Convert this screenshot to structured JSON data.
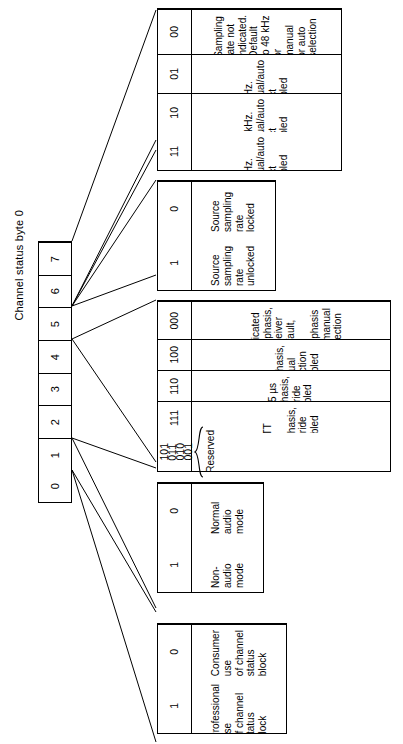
{
  "diagram": {
    "title": "Channel status byte 0"
  },
  "bit_strip": {
    "name": "channel-status-byte-0-bits",
    "bits": [
      {
        "label": "0"
      },
      {
        "label": "1"
      },
      {
        "label": "2"
      },
      {
        "label": "3"
      },
      {
        "label": "4"
      },
      {
        "label": "5"
      },
      {
        "label": "6"
      },
      {
        "label": "7"
      }
    ]
  },
  "tables": [
    {
      "id": "sampling-rate-table",
      "source_bits": "6,7",
      "rows": [
        {
          "code": "00",
          "desc": "Sampling rate not\nindicated. Default\nto 48 kHz or manual\nor auto selection"
        },
        {
          "code": "01",
          "desc": "48 kHz. Manual/auto\nselect disabled"
        },
        {
          "code": "10",
          "desc": "44.1 kHz. Manual/auto\nselect disabled"
        },
        {
          "code": "11",
          "desc": "32 kHz. Manual/auto\nselect disabled"
        }
      ]
    },
    {
      "id": "source-lock-table",
      "source_bits": "5",
      "rows": [
        {
          "code": "0",
          "desc": "Source sampling\nrate locked"
        },
        {
          "code": "1",
          "desc": "Source sampling\nrate unlocked"
        }
      ]
    },
    {
      "id": "emphasis-table",
      "source_bits": "2,3,4",
      "rows": [
        {
          "code": "000",
          "desc": "No indicated emphasis,\nreceiver default, no\nemphasis or manual\nselection"
        },
        {
          "code": "100",
          "desc": "No emphasis, manual\nselection disabled"
        },
        {
          "code": "110",
          "desc": "50/15 µs emphasis,\noverride disabled"
        },
        {
          "code": "111",
          "desc": "CCITT J.17 emphasis,\noverride disabled"
        }
      ],
      "reserved_row": {
        "codes": [
          "001",
          "010",
          "011",
          "101"
        ],
        "label": "Reserved"
      }
    },
    {
      "id": "audio-mode-table",
      "source_bits": "1",
      "rows": [
        {
          "code": "0",
          "desc": "Normal audio\nmode"
        },
        {
          "code": "1",
          "desc": "Non-audio\nmode"
        }
      ]
    },
    {
      "id": "use-table",
      "source_bits": "0",
      "rows": [
        {
          "code": "0",
          "desc": "Consumer use\nof channel status\nblock"
        },
        {
          "code": "1",
          "desc": "Professional use\nof channel status\nblock"
        }
      ]
    }
  ],
  "style": {
    "line_color": "#000000",
    "background": "#ffffff",
    "text_color": "#000000"
  }
}
